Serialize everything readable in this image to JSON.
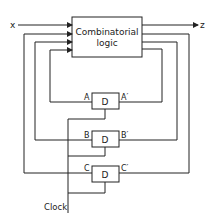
{
  "diagram": {
    "input_label": "x",
    "output_label": "z",
    "logic_block": {
      "line1": "Combinatorial",
      "line2": "logic"
    },
    "flipflops": [
      {
        "type": "D",
        "input": "A",
        "output": "A′"
      },
      {
        "type": "D",
        "input": "B",
        "output": "B′"
      },
      {
        "type": "D",
        "input": "C",
        "output": "C′"
      }
    ],
    "clock_label": "Clock"
  }
}
